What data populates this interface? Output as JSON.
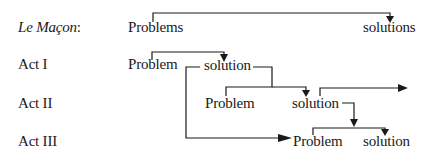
{
  "diagram": {
    "rows": [
      {
        "label": "Le Maçon:",
        "label_main": "Le Maçon",
        "label_suffix": ":",
        "italic": true,
        "nodes": [
          {
            "text": "Problems"
          },
          {
            "text": "solutions"
          }
        ]
      },
      {
        "label": "Act I",
        "nodes": [
          {
            "text": "Problem"
          },
          {
            "text": "solution"
          }
        ]
      },
      {
        "label": "Act II",
        "nodes": [
          {
            "text": "Problem"
          },
          {
            "text": "solution"
          }
        ]
      },
      {
        "label": "Act III",
        "nodes": [
          {
            "text": "Problem"
          },
          {
            "text": "solution"
          }
        ]
      }
    ],
    "edges": [
      {
        "from": "Le Maçon Problems",
        "to": "Le Maçon solutions"
      },
      {
        "from": "Act I Problem",
        "to": "Act I solution"
      },
      {
        "from": "Act I solution",
        "to": "Act II Problem"
      },
      {
        "from": "Act I solution",
        "to": "Act III Problem"
      },
      {
        "from": "Act II Problem",
        "to": "Act II solution"
      },
      {
        "from": "Act II solution",
        "to": "(continues right)"
      },
      {
        "from": "Act II solution",
        "to": "Act III Problem/solution bracket"
      },
      {
        "from": "Act III Problem",
        "to": "Act III solution"
      }
    ],
    "line_color": "#1a1a1a"
  }
}
